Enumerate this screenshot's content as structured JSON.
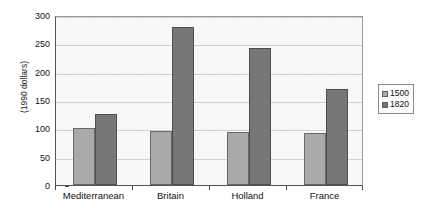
{
  "chart_data": {
    "type": "bar",
    "title": "",
    "subtitle": "",
    "xlabel": "",
    "ylabel": "(1990 dollars)",
    "ylim": [
      0,
      300
    ],
    "yticks": [
      0,
      50,
      100,
      150,
      200,
      250,
      300
    ],
    "ytick_labels": [
      "0",
      "50",
      "100",
      "150",
      "200",
      "250",
      "300"
    ],
    "grid": true,
    "legend_position": "right",
    "categories": [
      "Mediterranean",
      "Britain",
      "Holland",
      "France"
    ],
    "series": [
      {
        "name": "1500",
        "color": "#ababab",
        "values": [
          100,
          95,
          94,
          91
        ]
      },
      {
        "name": "1820",
        "color": "#787878",
        "values": [
          125,
          278,
          242,
          170
        ]
      }
    ]
  },
  "legend": {
    "items": [
      {
        "label": "1500",
        "color": "#ababab"
      },
      {
        "label": "1820",
        "color": "#787878"
      }
    ]
  },
  "colors": {
    "series_1500": "#ababab",
    "series_1820": "#787878",
    "axis": "#555555",
    "gridline": "#d2d2d2",
    "plot_background": "#fafafa",
    "text": "#111111"
  }
}
